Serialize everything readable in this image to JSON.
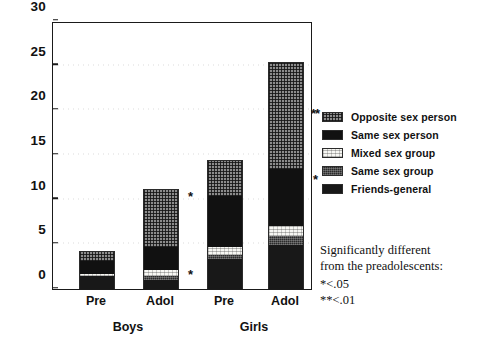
{
  "chart_data": {
    "type": "bar",
    "stacked": true,
    "title": "",
    "xlabel": "",
    "ylabel": "",
    "ylim": [
      0,
      30
    ],
    "yticks": [
      0,
      5,
      10,
      15,
      20,
      25,
      30
    ],
    "grid": true,
    "legend_position": "right",
    "categories": [
      "Pre",
      "Adol",
      "Pre",
      "Adol"
    ],
    "groups": [
      {
        "label": "Boys",
        "categories": [
          "Pre",
          "Adol"
        ]
      },
      {
        "label": "Girls",
        "categories": [
          "Pre",
          "Adol"
        ]
      }
    ],
    "series": [
      {
        "name": "Friends-general",
        "values": [
          1.5,
          1.0,
          3.4,
          4.9
        ]
      },
      {
        "name": "Same sex group",
        "values": [
          0.0,
          0.5,
          0.4,
          1.1
        ]
      },
      {
        "name": "Mixed sex group",
        "values": [
          0.2,
          0.7,
          0.9,
          1.1
        ]
      },
      {
        "name": "Same sex person",
        "values": [
          1.5,
          2.6,
          5.8,
          6.4
        ]
      },
      {
        "name": "Opposite sex person",
        "values": [
          1.0,
          6.4,
          3.9,
          11.9
        ]
      }
    ],
    "totals": [
      4.2,
      11.2,
      14.4,
      25.4
    ],
    "annotations": [
      {
        "text": "*",
        "bar": "Boys Adol",
        "y": 9.0
      },
      {
        "text": "*",
        "bar": "Boys Adol",
        "y": 0.2
      },
      {
        "text": "**",
        "bar": "Girls Adol",
        "y": 18.3
      },
      {
        "text": "*",
        "bar": "Girls Adol",
        "y": 10.9
      }
    ]
  },
  "legend": {
    "items": [
      {
        "label": "Opposite sex person",
        "swatch": "opposite-sex-person-swatch"
      },
      {
        "label": "Same sex person",
        "swatch": "same-sex-person-swatch"
      },
      {
        "label": "Mixed sex group",
        "swatch": "mixed-sex-group-swatch"
      },
      {
        "label": "Same sex group",
        "swatch": "same-sex-group-swatch"
      },
      {
        "label": "Friends-general",
        "swatch": "friends-general-swatch"
      }
    ]
  },
  "footnote": {
    "line1": "Significantly different",
    "line2": "from the preadolescents:",
    "line3": "*<.05",
    "line4": "**<.01"
  },
  "axis": {
    "y": {
      "t0": "0",
      "t1": "5",
      "t2": "10",
      "t3": "15",
      "t4": "20",
      "t5": "25",
      "t6": "30"
    }
  }
}
